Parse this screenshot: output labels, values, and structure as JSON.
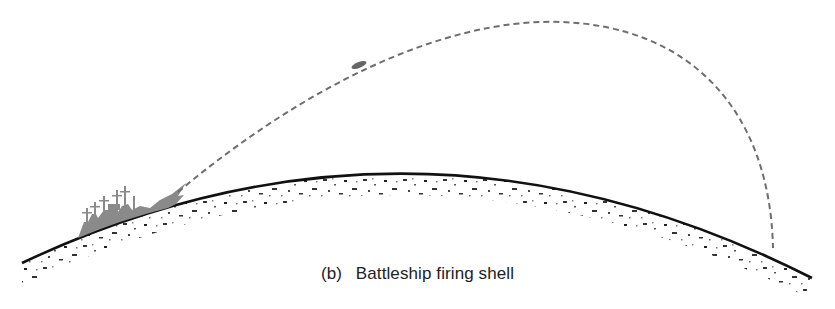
{
  "figure": {
    "caption_label": "(b)",
    "caption_text": "Battleship firing shell",
    "elements": {
      "earth_surface": "curved-earth-surface",
      "battleship": "battleship-silhouette",
      "shell": "shell-projectile",
      "trajectory": "dashed-trajectory"
    },
    "colors": {
      "earth_line": "#111111",
      "trajectory": "#6e6e6e",
      "ship": "#8a8a8a",
      "speckle": "#333333"
    }
  }
}
